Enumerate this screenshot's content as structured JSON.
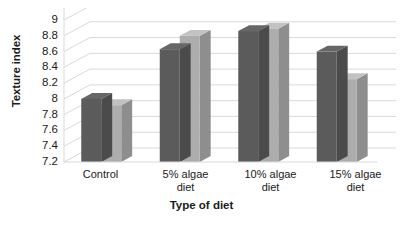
{
  "chart_data": {
    "type": "bar",
    "title": "",
    "xlabel": "Type of diet",
    "ylabel": "Texture index",
    "categories": [
      "Control",
      "5% algae diet",
      "10% algae diet",
      "15% algae diet"
    ],
    "series": [
      {
        "name": "series-1-dark",
        "color": "#5b5b5b",
        "values": [
          8.0,
          8.63,
          8.86,
          8.6
        ]
      },
      {
        "name": "series-2-light",
        "color": "#adadad",
        "values": [
          7.92,
          8.8,
          8.89,
          8.25
        ]
      }
    ],
    "ylim": [
      7.2,
      9.0
    ],
    "ystep": 0.2,
    "yticks": [
      "9",
      "8.8",
      "8.6",
      "8.4",
      "8.2",
      "8",
      "7.8",
      "7.6",
      "7.4",
      "7.2"
    ],
    "ytick_values": [
      9,
      8.8,
      8.6,
      8.4,
      8.2,
      8,
      7.8,
      7.6,
      7.4,
      7.2
    ],
    "grid": true,
    "grid_color": "#d9d9d9",
    "legend": "none",
    "style": "3d-perspective",
    "background": "#ffffff"
  },
  "xlabels": [
    {
      "line1": "Control",
      "line2": ""
    },
    {
      "line1": "5% algae",
      "line2": "diet"
    },
    {
      "line1": "10% algae",
      "line2": "diet"
    },
    {
      "line1": "15% algae",
      "line2": "diet"
    }
  ]
}
